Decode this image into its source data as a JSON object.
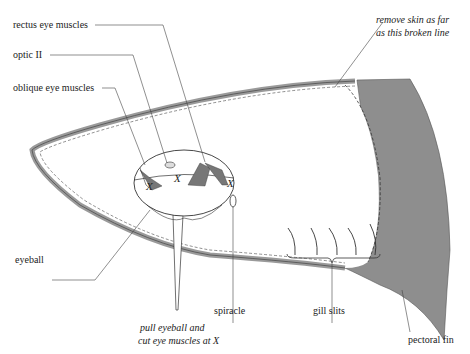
{
  "diagram": {
    "labels": {
      "rectus": "rectus eye muscles",
      "optic": "optic II",
      "oblique": "oblique eye muscles",
      "eyeball": "eyeball",
      "spiracle": "spiracle",
      "gill_slits": "gill slits",
      "pectoral_fin": "pectoral fin",
      "remove_skin_line1": "remove skin as far",
      "remove_skin_line2": "as this broken line",
      "instruction_line1": "pull eyeball and",
      "instruction_line2": "cut eye muscles at X"
    },
    "cut_marks": [
      "X",
      "X",
      "X"
    ],
    "colors": {
      "outline": "#333333",
      "skin_band": "#9a9a9a",
      "fin_fill": "#8e8e8e",
      "leader": "#444444"
    }
  }
}
